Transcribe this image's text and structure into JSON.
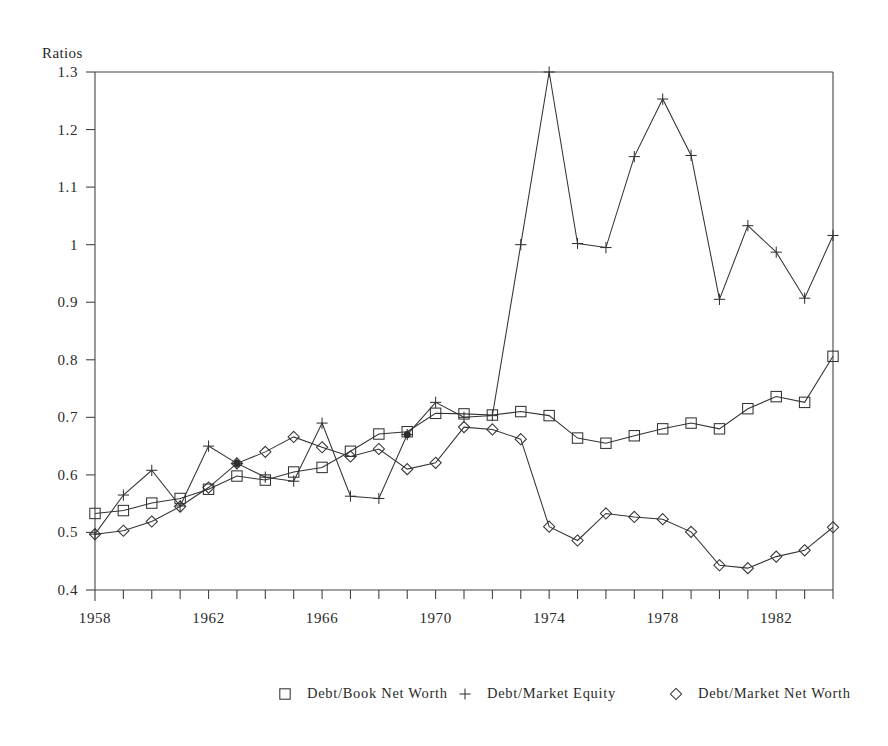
{
  "chart_data": {
    "type": "line",
    "title": "",
    "ylabel": "Ratios",
    "xlabel": "",
    "ylim": [
      0.4,
      1.3
    ],
    "xlim": [
      1958,
      1984
    ],
    "ytick_labels": [
      "1.3",
      "1.2",
      "1.1",
      "1",
      "0.9",
      "0.8",
      "0.7",
      "0.6",
      "0.5",
      "0.4"
    ],
    "ytick_values": [
      1.3,
      1.2,
      1.1,
      1.0,
      0.9,
      0.8,
      0.7,
      0.6,
      0.5,
      0.4
    ],
    "xtick_labels": [
      "1958",
      "1962",
      "1966",
      "1970",
      "1974",
      "1978",
      "1982"
    ],
    "xtick_values": [
      1958,
      1962,
      1966,
      1970,
      1974,
      1978,
      1982
    ],
    "x": [
      1958,
      1959,
      1960,
      1961,
      1962,
      1963,
      1964,
      1965,
      1966,
      1967,
      1968,
      1969,
      1970,
      1971,
      1972,
      1973,
      1974,
      1975,
      1976,
      1977,
      1978,
      1979,
      1980,
      1981,
      1982,
      1983,
      1984
    ],
    "grid": false,
    "legend_position": "bottom",
    "series": [
      {
        "name": "Debt/Book Net Worth",
        "marker": "square",
        "values": [
          0.533,
          0.538,
          0.551,
          0.559,
          0.575,
          0.598,
          0.591,
          0.605,
          0.613,
          0.641,
          0.671,
          0.675,
          0.707,
          0.706,
          0.704,
          0.71,
          0.703,
          0.664,
          0.655,
          0.668,
          0.68,
          0.69,
          0.68,
          0.715,
          0.736,
          0.726,
          0.806
        ]
      },
      {
        "name": "Debt/Market Equity",
        "marker": "plus",
        "values": [
          0.497,
          0.565,
          0.608,
          0.546,
          0.65,
          0.62,
          0.596,
          0.589,
          0.69,
          0.563,
          0.559,
          0.67,
          0.726,
          0.7,
          0.703,
          1.0,
          1.3,
          1.002,
          0.995,
          1.153,
          1.253,
          1.155,
          0.905,
          1.033,
          0.987,
          0.907,
          1.016
        ]
      },
      {
        "name": "Debt/Market Net Worth",
        "marker": "diamond",
        "values": [
          0.497,
          0.503,
          0.519,
          0.545,
          0.578,
          0.62,
          0.64,
          0.666,
          0.648,
          0.632,
          0.645,
          0.61,
          0.621,
          0.683,
          0.679,
          0.662,
          0.51,
          0.486,
          0.533,
          0.527,
          0.523,
          0.501,
          0.443,
          0.438,
          0.458,
          0.469,
          0.509
        ]
      }
    ],
    "filled_points": [
      {
        "series": 1,
        "x": 1963
      },
      {
        "series": 1,
        "x": 1969
      }
    ],
    "legend": [
      {
        "marker": "square",
        "label": "Debt/Book Net Worth"
      },
      {
        "marker": "plus",
        "label": "Debt/Market Equity"
      },
      {
        "marker": "diamond",
        "label": "Debt/Market Net Worth"
      }
    ],
    "colors": {
      "line": "#333333",
      "axis": "#444444",
      "text": "#2a2a2a",
      "background": "#ffffff"
    }
  }
}
